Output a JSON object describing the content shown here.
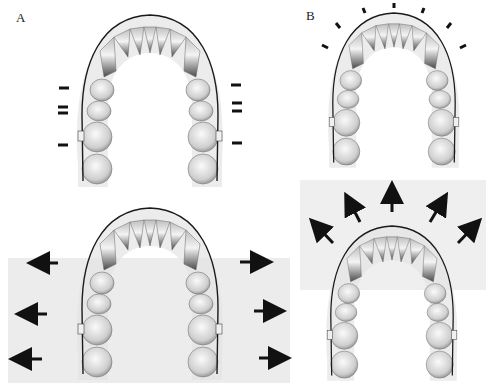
{
  "figure": {
    "type": "dental-arch-diagram",
    "panels": [
      {
        "id": "A",
        "label": "A",
        "position": "top-left",
        "arrows": "none",
        "force_marks": "lateral-posterior"
      },
      {
        "id": "B",
        "label": "B",
        "position": "top-right",
        "arrows": "none",
        "force_marks": "anterior-radial"
      },
      {
        "id": "C",
        "label": "",
        "position": "bottom-left",
        "arrows": "lateral-expansion",
        "arrow_count": 6
      },
      {
        "id": "D",
        "label": "",
        "position": "bottom-right",
        "arrows": "anterior-radial-expansion",
        "arrow_count": 5
      }
    ],
    "colors": {
      "tooth_light": "#e8e8e8",
      "tooth_dark": "#7a7a7a",
      "wire": "#1a1a1a",
      "gum_shadow": "#d6d6d6",
      "background_panel": "#ececec",
      "arrow": "#111111"
    }
  }
}
